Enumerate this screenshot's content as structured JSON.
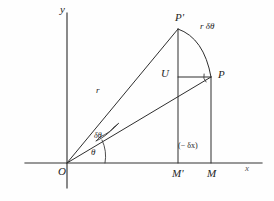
{
  "axes": {
    "x_label": "x",
    "y_label": "y",
    "origin_label": "O"
  },
  "points": {
    "P_prime": "P'",
    "P": "P",
    "U": "U",
    "M_prime": "M'",
    "M": "M"
  },
  "labels": {
    "radius": "r",
    "arc_length": "r δθ",
    "delta_theta": "δθ",
    "theta": "θ",
    "delta_x": "(− δx)"
  },
  "colors": {
    "ink": "#2e2e2e",
    "axis": "#333333",
    "background": "#fefefe"
  },
  "geometry": {
    "origin": {
      "x": 67,
      "y": 163
    },
    "P_prime": {
      "x": 178,
      "y": 29
    },
    "P": {
      "x": 211,
      "y": 77
    },
    "U": {
      "x": 178,
      "y": 77
    },
    "M_prime": {
      "x": 178,
      "y": 163
    },
    "M": {
      "x": 211,
      "y": 163
    },
    "x_axis": {
      "x1": 25,
      "x2": 262,
      "y": 163
    },
    "y_axis": {
      "x": 67,
      "y1": 13,
      "y2": 188
    }
  }
}
